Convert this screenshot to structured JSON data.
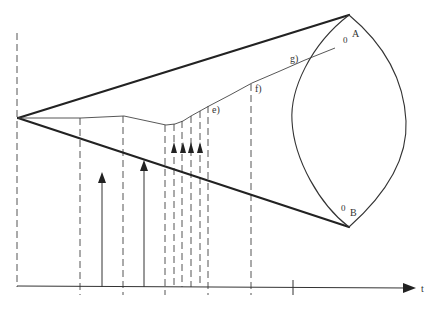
{
  "diagram": {
    "type": "cone-lens-timing-diagram",
    "axis": {
      "label": "t"
    },
    "vertices": {
      "apex": {
        "x": 18,
        "y": 118
      },
      "A": {
        "x": 349,
        "y": 15
      },
      "B": {
        "x": 349,
        "y": 227
      }
    },
    "labels": {
      "top_vertex_prefix": "0",
      "top_vertex": "A",
      "bottom_vertex_prefix": "0",
      "bottom_vertex": "B",
      "point_e": "e)",
      "point_f": "f)",
      "point_g": "g)",
      "axis_t": "t"
    },
    "dashed_lines_x": [
      17,
      80,
      123,
      165,
      174,
      182,
      191,
      200,
      208,
      250
    ],
    "axis_ticks_x": [
      80,
      123,
      165,
      208,
      250,
      293
    ],
    "arrows": [
      {
        "x": 102,
        "tip_y": 173,
        "base_y": 287
      },
      {
        "x": 144,
        "tip_y": 161,
        "base_y": 287
      },
      {
        "x": 174,
        "tip_y": 143,
        "base_y": 153
      },
      {
        "x": 183,
        "tip_y": 143,
        "base_y": 153
      },
      {
        "x": 191,
        "tip_y": 143,
        "base_y": 153
      },
      {
        "x": 200,
        "tip_y": 143,
        "base_y": 153
      }
    ],
    "colors": {
      "stroke": "#222222",
      "dashed": "#555555",
      "background": "#ffffff"
    }
  }
}
